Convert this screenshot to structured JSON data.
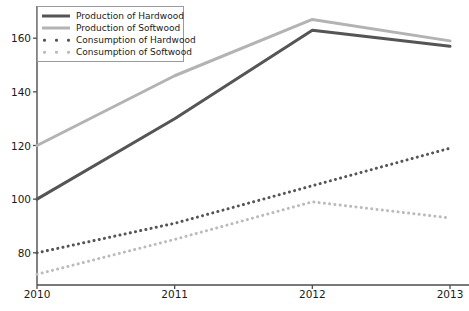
{
  "chart_data": {
    "type": "line",
    "title": "",
    "xlabel": "",
    "ylabel": "",
    "x": [
      2010,
      2011,
      2012,
      2013
    ],
    "categories": [
      "2010",
      "2011",
      "2012",
      "2013"
    ],
    "xlim": [
      2010,
      2013
    ],
    "ylim": [
      68,
      172
    ],
    "xticks": [
      "2010",
      "2011",
      "2012",
      "2013"
    ],
    "yticks": [
      "80",
      "100",
      "120",
      "140",
      "160"
    ],
    "grid": false,
    "legend_position": "upper left",
    "series": [
      {
        "name": "Production of Hardwood",
        "values": [
          100,
          130,
          163,
          157
        ],
        "style": "solid",
        "color": "#555555",
        "linewidth": 3
      },
      {
        "name": "Production of Softwood",
        "values": [
          120,
          146,
          167,
          159
        ],
        "style": "solid",
        "color": "#b3b3b3",
        "linewidth": 3
      },
      {
        "name": "Consumption of Hardwood",
        "values": [
          80,
          91,
          105,
          119
        ],
        "style": "dotted",
        "color": "#555555",
        "linewidth": 3
      },
      {
        "name": "Consumption of Softwood",
        "values": [
          72,
          85,
          99,
          93
        ],
        "style": "dotted",
        "color": "#bbbbbb",
        "linewidth": 3
      }
    ]
  },
  "axis": {
    "spine_color": "#4d4d4d",
    "tick_color": "#4d4d4d",
    "label_color": "#1a1a1a"
  }
}
